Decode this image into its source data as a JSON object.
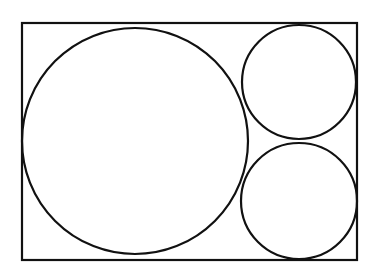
{
  "diagram": {
    "stroke_color": "#111111",
    "background": "#ffffff",
    "rectangle": {
      "x": 22,
      "y": 23,
      "width": 335,
      "height": 237
    },
    "circles": [
      {
        "name": "large-circle",
        "cx": 135,
        "cy": 141,
        "r": 113
      },
      {
        "name": "small-circle-top",
        "cx": 299,
        "cy": 82,
        "r": 57
      },
      {
        "name": "small-circle-bottom",
        "cx": 299,
        "cy": 201,
        "r": 58
      }
    ]
  }
}
